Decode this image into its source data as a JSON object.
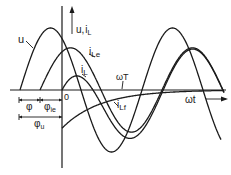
{
  "diagram": {
    "axis_labels": {
      "y_main": "u,",
      "y_sub_i": "i",
      "y_sub_L": "L",
      "x": "ωt",
      "origin": "0"
    },
    "curve_labels": {
      "u": "u",
      "iLe_i": "i",
      "iLe_sub": "Le",
      "iL_i": "i",
      "iL_sub": "L",
      "iLf_i": "i",
      "iLf_sub": "Lf",
      "omegaT": "ωT"
    },
    "phase_labels": {
      "phi": "φ",
      "phi_ie": "φ",
      "phi_ie_sub": "ie",
      "phi_u": "φ",
      "phi_u_sub": "u"
    },
    "curves": [
      {
        "name": "u",
        "amplitude": 1.0,
        "phase_offset_deg": 60
      },
      {
        "name": "i_Le",
        "amplitude": 0.68,
        "phase_offset_deg": 25
      },
      {
        "name": "i_L",
        "description": "sum of i_Le and i_Lf"
      },
      {
        "name": "i_Lf",
        "description": "decaying exponential transient starting at -0.53"
      }
    ]
  }
}
